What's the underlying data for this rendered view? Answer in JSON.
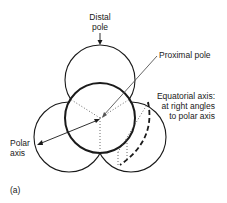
{
  "figure": {
    "panel_label": "(a)",
    "labels": {
      "distal_pole": [
        "Distal",
        "pole"
      ],
      "proximal_pole": "Proximal pole",
      "equatorial_axis": [
        "Equatorial axis:",
        "at right angles",
        "to polar axis"
      ],
      "polar_axis": [
        "Polar",
        "axis"
      ]
    },
    "colors": {
      "line": "#1a1a1a",
      "pointer": "#555555",
      "background": "#ffffff"
    }
  }
}
